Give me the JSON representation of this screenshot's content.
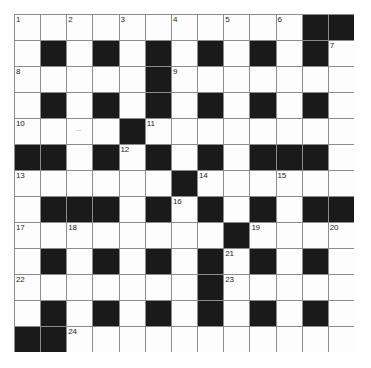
{
  "puzzle": {
    "title": "Crossword Grid",
    "type": "crossword",
    "rows": 13,
    "cols": 13,
    "colors": {
      "block": "#1a1a1a",
      "cell": "#fdfdfd",
      "gridline": "#8c8c8c",
      "number": "#1d1d1d",
      "background": "#ffffff"
    },
    "legend": {
      "block_char": "#",
      "open_char": "."
    },
    "layout": [
      "...........##",
      ".#.#.#.#.#.#.",
      ".....#.......",
      ".#.#.#.#.#.#.",
      "....#........",
      "##.#.#.#.###.",
      "......#......",
      ".###.#.#.#.##",
      "........#....",
      ".#.#.#.#.#.#.",
      ".......#.....",
      ".#.#.#.#.#.#.",
      "##..........."
    ],
    "numbers": [
      {
        "n": 1,
        "row": 0,
        "col": 0
      },
      {
        "n": 2,
        "row": 0,
        "col": 2
      },
      {
        "n": 3,
        "row": 0,
        "col": 4
      },
      {
        "n": 4,
        "row": 0,
        "col": 6
      },
      {
        "n": 5,
        "row": 0,
        "col": 8
      },
      {
        "n": 6,
        "row": 0,
        "col": 10
      },
      {
        "n": 7,
        "row": 1,
        "col": 12
      },
      {
        "n": 8,
        "row": 2,
        "col": 0
      },
      {
        "n": 9,
        "row": 2,
        "col": 6
      },
      {
        "n": 10,
        "row": 4,
        "col": 0
      },
      {
        "n": 11,
        "row": 4,
        "col": 5
      },
      {
        "n": 12,
        "row": 5,
        "col": 4
      },
      {
        "n": 13,
        "row": 6,
        "col": 0
      },
      {
        "n": 14,
        "row": 6,
        "col": 7
      },
      {
        "n": 15,
        "row": 6,
        "col": 10
      },
      {
        "n": 16,
        "row": 7,
        "col": 6
      },
      {
        "n": 17,
        "row": 8,
        "col": 0
      },
      {
        "n": 18,
        "row": 8,
        "col": 2
      },
      {
        "n": 19,
        "row": 8,
        "col": 9
      },
      {
        "n": 20,
        "row": 8,
        "col": 12
      },
      {
        "n": 21,
        "row": 9,
        "col": 8
      },
      {
        "n": 22,
        "row": 10,
        "col": 0
      },
      {
        "n": 23,
        "row": 10,
        "col": 8
      },
      {
        "n": 24,
        "row": 12,
        "col": 2
      }
    ],
    "artifacts": [
      {
        "kind": "scan-speck",
        "row": 4,
        "col": 2
      }
    ]
  }
}
